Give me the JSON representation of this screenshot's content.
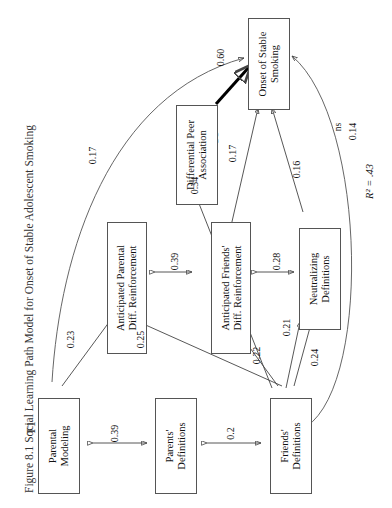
{
  "figure": {
    "number": "Figure 8.1",
    "title": "Social Learning Path Model for Onset of Stable Adolescent Smoking",
    "full_title": "Figure 8.1   Social Learning Path Model for Onset of Stable Adolescent Smoking"
  },
  "time_labels": [
    {
      "id": "t1",
      "label": "T1"
    },
    {
      "id": "t2",
      "label": "T2"
    },
    {
      "id": "t3",
      "label": "T3"
    },
    {
      "id": "t5",
      "label": "T5"
    }
  ],
  "nodes": [
    {
      "id": "parental-modeling",
      "label": "Parental\nModeling",
      "line1": "Parental",
      "line2": "Modeling",
      "wave": "T1"
    },
    {
      "id": "parents-definitions",
      "label": "Parents'\nDefinitions",
      "line1": "Parents'",
      "line2": "Definitions",
      "wave": "T1"
    },
    {
      "id": "friends-definitions",
      "label": "Friends'\nDefinitions",
      "line1": "Friends'",
      "line2": "Definitions",
      "wave": "T1"
    },
    {
      "id": "anticipated-parental",
      "label": "Anticipated Parental\nDiff. Reinforcement",
      "line1": "Anticipated Parental",
      "line2": "Diff. Reinforcement",
      "wave": "T2"
    },
    {
      "id": "anticipated-friends",
      "label": "Anticipated Friends'\nDiff. Reinforcement",
      "line1": "Anticipated Friends'",
      "line2": "Diff. Reinforcement",
      "wave": "T2"
    },
    {
      "id": "neutralizing",
      "label": "Neutralizing\nDefinitions",
      "line1": "Neutralizing",
      "line2": "Definitions",
      "wave": "T2"
    },
    {
      "id": "differential-peer",
      "label": "Differential Peer\nAssociation",
      "line1": "Differential Peer",
      "line2": "Association",
      "wave": "T3"
    },
    {
      "id": "onset-smoking",
      "label": "Onset of Stable\nSmoking",
      "line1": "Onset of Stable",
      "line2": "Smoking",
      "wave": "T5"
    }
  ],
  "paths": [
    {
      "id": "p-0-39-a",
      "coefficient": "0.39",
      "from": "parental-modeling",
      "to": "parents-definitions",
      "style": "double"
    },
    {
      "id": "p-0-2",
      "coefficient": "0.2",
      "from": "parents-definitions",
      "to": "friends-definitions",
      "style": "double"
    },
    {
      "id": "p-0-23",
      "coefficient": "0.23",
      "from": "parental-modeling",
      "to": "anticipated-parental",
      "style": "single"
    },
    {
      "id": "p-0-25",
      "coefficient": "0.25",
      "from": "friends-definitions",
      "to": "anticipated-parental",
      "style": "single"
    },
    {
      "id": "p-0-39-b",
      "coefficient": "0.39",
      "from": "anticipated-parental",
      "to": "anticipated-friends",
      "style": "double"
    },
    {
      "id": "p-0-28",
      "coefficient": "0.28",
      "from": "anticipated-friends",
      "to": "neutralizing",
      "style": "double"
    },
    {
      "id": "p-0-22",
      "coefficient": "0.22",
      "from": "friends-definitions",
      "to": "anticipated-friends",
      "style": "single"
    },
    {
      "id": "p-0-21",
      "coefficient": "0.21",
      "from": "friends-definitions",
      "to": "neutralizing",
      "style": "single"
    },
    {
      "id": "p-0-24",
      "coefficient": "0.24",
      "from": "friends-definitions",
      "to": "neutralizing",
      "style": "single"
    },
    {
      "id": "p-0-34",
      "coefficient": "0.34",
      "from": "friends-definitions",
      "to": "differential-peer",
      "style": "single"
    },
    {
      "id": "p-0-17-a",
      "coefficient": "0.17",
      "from": "anticipated-friends",
      "to": "onset-smoking",
      "style": "single"
    },
    {
      "id": "p-0-60",
      "coefficient": "0.60",
      "from": "differential-peer",
      "to": "onset-smoking",
      "style": "bold"
    },
    {
      "id": "p-0-16",
      "coefficient": "0.16",
      "from": "neutralizing",
      "to": "onset-smoking",
      "style": "single"
    },
    {
      "id": "p-0-17-b",
      "coefficient": "0.17",
      "from": "parental-modeling",
      "to": "onset-smoking",
      "style": "curve"
    },
    {
      "id": "p-ns",
      "coefficient": "0.14",
      "significance": "ns",
      "from": "friends-definitions",
      "to": "onset-smoking",
      "style": "curve"
    }
  ],
  "statistics": {
    "r_squared_label": "R² = .43",
    "r_squared_value": ".43"
  }
}
